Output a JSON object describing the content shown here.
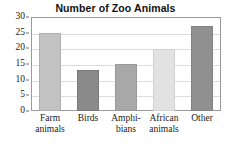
{
  "chart_data": {
    "type": "bar",
    "title": "Number of Zoo Animals",
    "xlabel": "",
    "ylabel": "",
    "categories": [
      "Farm animals",
      "Birds",
      "Amphi-bians",
      "African animals",
      "Other"
    ],
    "category_lines": [
      [
        "Farm",
        "animals"
      ],
      [
        "Birds"
      ],
      [
        "Amphi-",
        "bians"
      ],
      [
        "African",
        "animals"
      ],
      [
        "Other"
      ]
    ],
    "values": [
      25,
      13,
      15,
      19.7,
      27
    ],
    "ylim": [
      0,
      30
    ],
    "yticks": [
      0,
      5,
      10,
      15,
      20,
      25,
      30
    ],
    "ytick_labels": [
      "0",
      "5",
      "10",
      "15",
      "20",
      "25",
      "30"
    ],
    "grid": true,
    "legend": "none",
    "bar_colors": [
      "#c2c2c2",
      "#8a8a8a",
      "#a8a8a8",
      "#e2e2e2",
      "#909090"
    ],
    "bar_border_colors": [
      "#b0b0b0",
      "#7c7c7c",
      "#9a9a9a",
      "#d2d2d2",
      "#828282"
    ],
    "frame_color": "#9a9a9a",
    "grid_color": "#dcdcdc",
    "background": "#ffffff"
  }
}
